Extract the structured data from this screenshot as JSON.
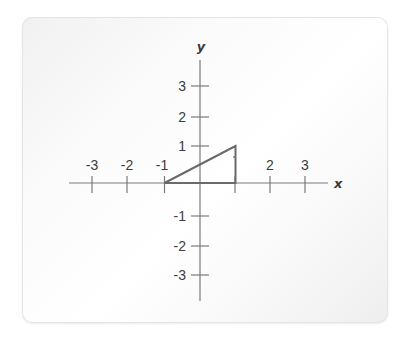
{
  "diagram": {
    "type": "coordinate-plane",
    "axes": {
      "x_label": "x",
      "y_label": "y",
      "x_ticks": [
        {
          "value": -3,
          "label": "-3",
          "px": 92
        },
        {
          "value": -2,
          "label": "-2",
          "px": 127
        },
        {
          "value": -1,
          "label": "-1",
          "px": 164.5
        },
        {
          "value": 1,
          "label": "1",
          "px": 235
        },
        {
          "value": 2,
          "label": "2",
          "px": 270
        },
        {
          "value": 3,
          "label": "3",
          "px": 305
        }
      ],
      "y_ticks": [
        {
          "value": 3,
          "label": "3",
          "py": 86
        },
        {
          "value": 2,
          "label": "2",
          "py": 117
        },
        {
          "value": 1,
          "label": "1",
          "py": 146
        },
        {
          "value": -1,
          "label": "-1",
          "py": 216
        },
        {
          "value": -2,
          "label": "-2",
          "py": 246
        },
        {
          "value": -3,
          "label": "-3",
          "py": 275
        }
      ]
    },
    "shape": {
      "name": "right-triangle",
      "vertices": [
        [
          -1,
          0
        ],
        [
          1,
          0
        ],
        [
          1,
          1
        ]
      ],
      "stroke_color": "#6a6a6a"
    },
    "colors": {
      "axis": "#7a7a7a",
      "label": "#3c3c3c"
    }
  },
  "labels": {
    "x_axis": "x",
    "y_axis": "y",
    "xt_m3": "-3",
    "xt_m2": "-2",
    "xt_m1": "-1",
    "xt_p2": "2",
    "xt_p3": "3",
    "yt_p3": "3",
    "yt_p2": "2",
    "yt_p1": "1",
    "yt_m1": "-1",
    "yt_m2": "-2",
    "yt_m3": "-3"
  }
}
